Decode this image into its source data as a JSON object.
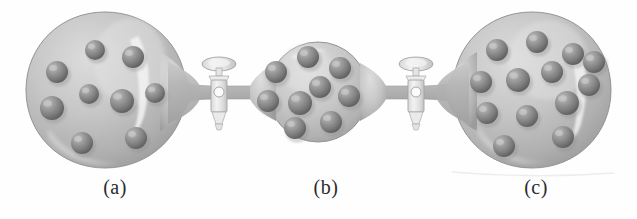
{
  "figure": {
    "background_color": "#fefefe"
  },
  "palette": {
    "flask_glass_light": "#d4d4d4",
    "flask_glass_mid": "#b8b8b8",
    "flask_glass_dark": "#9d9d9d",
    "flask_edge": "#8f8f8f",
    "highlight": "#efefef",
    "sphere_light": "#b5b5b5",
    "sphere_mid": "#8d8d8d",
    "sphere_dark": "#6a6a6a",
    "tube_fill": "#b2b2b2",
    "valve_body": "#e6e6e6",
    "valve_edge": "#a6a6a6",
    "caption_color": "#2b2b2b"
  },
  "captions": [
    {
      "id": "cap-a",
      "label": "(a)",
      "x": 70,
      "y": 176
    },
    {
      "id": "cap-b",
      "label": "(b)",
      "x": 281,
      "y": 176
    },
    {
      "id": "cap-c",
      "label": "(c)",
      "x": 491,
      "y": 176
    }
  ],
  "flasks": [
    {
      "name": "flask-a",
      "label": "(a)",
      "cx": 105,
      "cy": 90,
      "rx": 80,
      "ry": 78,
      "particle_count": 9,
      "particles": [
        {
          "cx": 57,
          "cy": 72,
          "r": 11
        },
        {
          "cx": 95,
          "cy": 50,
          "r": 10
        },
        {
          "cx": 133,
          "cy": 57,
          "r": 11
        },
        {
          "cx": 89,
          "cy": 94,
          "r": 10
        },
        {
          "cx": 122,
          "cy": 101,
          "r": 12
        },
        {
          "cx": 155,
          "cy": 93,
          "r": 10
        },
        {
          "cx": 52,
          "cy": 108,
          "r": 12
        },
        {
          "cx": 82,
          "cy": 143,
          "r": 11
        },
        {
          "cx": 136,
          "cy": 138,
          "r": 11
        }
      ]
    },
    {
      "name": "flask-b",
      "label": "(b)",
      "cx": 318,
      "cy": 92,
      "rx": 49,
      "ry": 49,
      "particle_count": 9,
      "particles": [
        {
          "cx": 308,
          "cy": 57,
          "r": 11
        },
        {
          "cx": 276,
          "cy": 72,
          "r": 11
        },
        {
          "cx": 340,
          "cy": 68,
          "r": 11
        },
        {
          "cx": 320,
          "cy": 87,
          "r": 11
        },
        {
          "cx": 268,
          "cy": 101,
          "r": 11
        },
        {
          "cx": 300,
          "cy": 103,
          "r": 12
        },
        {
          "cx": 349,
          "cy": 96,
          "r": 11
        },
        {
          "cx": 331,
          "cy": 122,
          "r": 11
        },
        {
          "cx": 295,
          "cy": 128,
          "r": 11
        }
      ]
    },
    {
      "name": "flask-c",
      "label": "(c)",
      "cx": 532,
      "cy": 90,
      "rx": 80,
      "ry": 78,
      "particle_count": 13,
      "particles": [
        {
          "cx": 497,
          "cy": 50,
          "r": 11
        },
        {
          "cx": 537,
          "cy": 42,
          "r": 11
        },
        {
          "cx": 573,
          "cy": 54,
          "r": 11
        },
        {
          "cx": 481,
          "cy": 82,
          "r": 11
        },
        {
          "cx": 518,
          "cy": 80,
          "r": 12
        },
        {
          "cx": 552,
          "cy": 72,
          "r": 11
        },
        {
          "cx": 589,
          "cy": 85,
          "r": 11
        },
        {
          "cx": 487,
          "cy": 113,
          "r": 11
        },
        {
          "cx": 527,
          "cy": 116,
          "r": 11
        },
        {
          "cx": 567,
          "cy": 103,
          "r": 12
        },
        {
          "cx": 504,
          "cy": 146,
          "r": 11
        },
        {
          "cx": 563,
          "cy": 137,
          "r": 11
        },
        {
          "cx": 590,
          "cy": 62,
          "r": 0
        }
      ]
    }
  ],
  "tubes": [
    {
      "name": "tube-left",
      "x1": 170,
      "x2": 272,
      "y": 92,
      "thickness": 15
    },
    {
      "name": "tube-right",
      "x1": 364,
      "x2": 468,
      "y": 92,
      "thickness": 15
    }
  ],
  "valves": [
    {
      "name": "stopcock-left",
      "cx": 219,
      "cy": 92,
      "state": "closed",
      "bore_r": 5
    },
    {
      "name": "stopcock-right",
      "cx": 416,
      "cy": 92,
      "state": "closed",
      "bore_r": 5
    }
  ]
}
